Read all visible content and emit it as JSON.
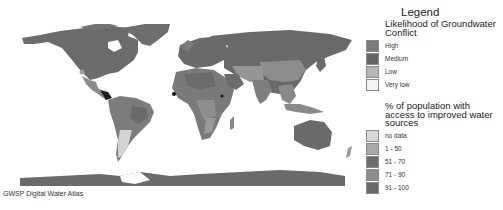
{
  "map": {
    "source_label": "GWSP Digital Water Atlas",
    "ocean_color": "#ffffff",
    "land_default_color": "#6e6e6e"
  },
  "legend": {
    "title": "Legend",
    "conflict": {
      "title_line1": "Likelihood of Groundwater",
      "title_line2": "Conflict",
      "items": [
        {
          "label": "High",
          "color": "#7b7b7b"
        },
        {
          "label": "Medium",
          "color": "#666666"
        },
        {
          "label": "Low",
          "color": "#b5b5b5"
        },
        {
          "label": "Very low",
          "color": "#f2f2f2"
        }
      ]
    },
    "access": {
      "title_line1": "% of population with",
      "title_line2": "access to improved water",
      "title_line3": "sources",
      "items": [
        {
          "label": "no data",
          "color": "#d8d8d8"
        },
        {
          "label": "1 - 50",
          "color": "#a9a9a9"
        },
        {
          "label": "51 - 70",
          "color": "#6d6d6d"
        },
        {
          "label": "71 - 90",
          "color": "#8c8c8c"
        },
        {
          "label": "91 - 100",
          "color": "#6a6a6a"
        }
      ]
    }
  }
}
